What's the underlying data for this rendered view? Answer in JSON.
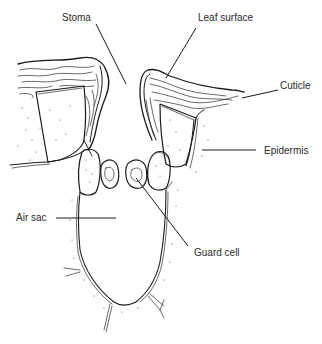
{
  "figure": {
    "labels": [
      {
        "id": "stoma",
        "text": "Stoma"
      },
      {
        "id": "leaf_surface",
        "text": "Leaf surface"
      },
      {
        "id": "cuticle",
        "text": "Cuticle"
      },
      {
        "id": "epidermis",
        "text": "Epidermis"
      },
      {
        "id": "air_sac",
        "text": "Air sac"
      },
      {
        "id": "guard_cell",
        "text": "Guard cell"
      }
    ]
  },
  "colors": {
    "ink": "#1a1a1a",
    "label_text": "#2a2a2a",
    "background": "#ffffff"
  }
}
